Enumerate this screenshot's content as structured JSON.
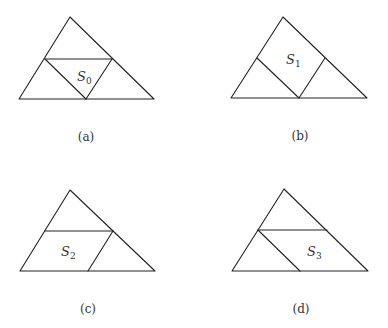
{
  "panels": [
    {
      "caption": "(a)",
      "region_label": "S",
      "region_subscript": "0",
      "description": "Triangle divided by midpoint segments; S0 is the central medial triangle"
    },
    {
      "caption": "(b)",
      "region_label": "S",
      "region_subscript": "1",
      "description": "Triangle with segments from bottom midpoint to left and right side midpoints; S1 is the upper quadrilateral"
    },
    {
      "caption": "(c)",
      "region_label": "S",
      "region_subscript": "2",
      "description": "Triangle with horizontal midline and segment from bottom midpoint to right side midpoint; S2 is the left parallelogram"
    },
    {
      "caption": "(d)",
      "region_label": "S",
      "region_subscript": "3",
      "description": "Triangle with horizontal midline and segment from left side midpoint to bottom midpoint; S3 is the right parallelogram"
    }
  ],
  "colors": {
    "stroke": "#222222",
    "text": "#333333",
    "background": "#ffffff"
  }
}
